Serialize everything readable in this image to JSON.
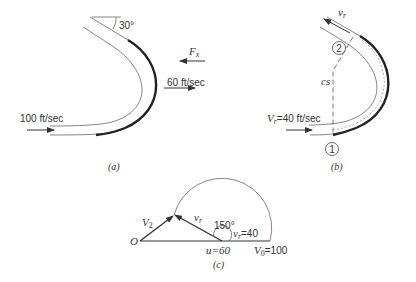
{
  "figure_a": {
    "caption": "(a)",
    "angle_label": "30°",
    "force_label": "F",
    "force_subscript": "x",
    "exit_velocity_label": "60 ft/sec",
    "inlet_velocity_label": "100 ft/sec"
  },
  "figure_b": {
    "caption": "(b)",
    "relative_velocity_label": "v",
    "relative_velocity_subscript": "r",
    "section_2_label": "2",
    "section_1_label": "1",
    "control_surface_label": "cs",
    "inlet_label": "V",
    "inlet_subscript": "r",
    "inlet_value": "=40 ft/sec"
  },
  "figure_c": {
    "caption": "(c)",
    "origin_label": "O",
    "v2_label": "V",
    "v2_subscript": "2",
    "vr_label": "v",
    "vr_subscript": "r",
    "angle_label": "150°",
    "vr_value_label": "v",
    "vr_value_subscript": "r",
    "vr_value": "=40",
    "u_label": "u=60",
    "v0_label": "V",
    "v0_subscript": "0",
    "v0_value": "=100"
  }
}
